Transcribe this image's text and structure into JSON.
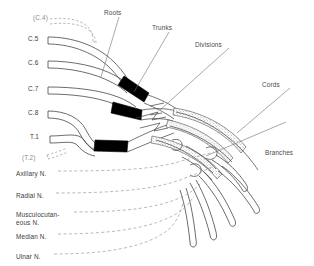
{
  "figure": {
    "background_color": "#ffffff",
    "ink_color": "#3b3b3b",
    "trunk_fill_color": "#000000",
    "cord_stipple_color": "#6f6f6f"
  },
  "sections": [
    {
      "id": "roots",
      "label": "Roots",
      "x": 104,
      "y": 9
    },
    {
      "id": "trunks",
      "label": "Trunks",
      "x": 152,
      "y": 24
    },
    {
      "id": "divisions",
      "label": "Divisions",
      "x": 195,
      "y": 41
    },
    {
      "id": "cords",
      "label": "Cords",
      "x": 262,
      "y": 81
    },
    {
      "id": "branches",
      "label": "Branches",
      "x": 265,
      "y": 149
    }
  ],
  "roots": [
    {
      "id": "c4",
      "label": "(C.4)",
      "x": 33,
      "y": 14,
      "style": "dashed",
      "parenthetical": true
    },
    {
      "id": "c5",
      "label": "C.5",
      "x": 28,
      "y": 35,
      "style": "solid",
      "parenthetical": false
    },
    {
      "id": "c6",
      "label": "C.6",
      "x": 28,
      "y": 59,
      "style": "solid",
      "parenthetical": false
    },
    {
      "id": "c7",
      "label": "C.7",
      "x": 28,
      "y": 85,
      "style": "solid",
      "parenthetical": false
    },
    {
      "id": "c8",
      "label": "C.8",
      "x": 28,
      "y": 109,
      "style": "solid",
      "parenthetical": false
    },
    {
      "id": "t1",
      "label": "T.1",
      "x": 30,
      "y": 133,
      "style": "solid",
      "parenthetical": false
    },
    {
      "id": "t2",
      "label": "(T.2)",
      "x": 22,
      "y": 154,
      "style": "dashed",
      "parenthetical": true
    }
  ],
  "branches": [
    {
      "id": "axillary",
      "label": "Axillary N.",
      "x": 16,
      "y": 170
    },
    {
      "id": "radial",
      "label": "Radial N.",
      "x": 16,
      "y": 192
    },
    {
      "id": "musculocutaneous",
      "label": "Musculocutan-\neous N.",
      "x": 16,
      "y": 211
    },
    {
      "id": "median",
      "label": "Median N.",
      "x": 16,
      "y": 233
    },
    {
      "id": "ulnar",
      "label": "Ulnar N.",
      "x": 16,
      "y": 253
    }
  ],
  "structure": {
    "trunk_count": 3,
    "trunk_names": [
      "Upper trunk",
      "Middle trunk",
      "Lower trunk"
    ],
    "cord_count": 3,
    "terminal_branch_count": 5
  }
}
